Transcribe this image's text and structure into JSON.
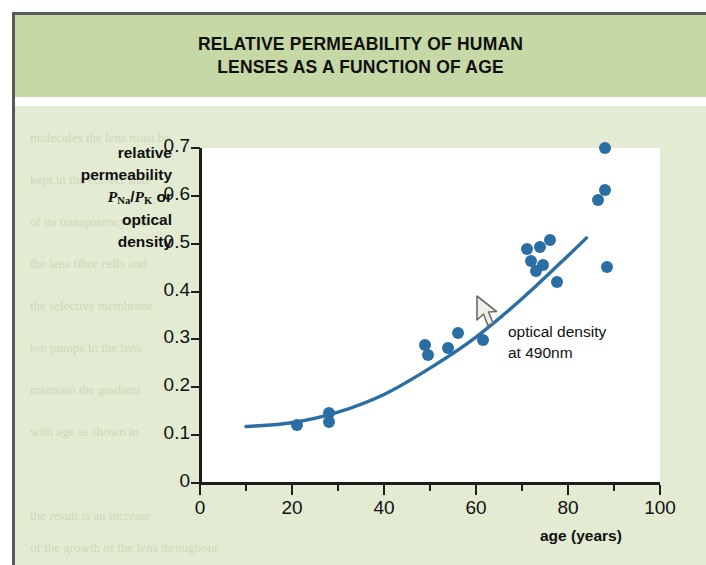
{
  "title": {
    "line1": "RELATIVE PERMEABILITY OF HUMAN",
    "line2": "LENSES AS A FUNCTION OF AGE"
  },
  "axes": {
    "y_title_lines": [
      "relative",
      "permeability",
      "P_Na/P_K or",
      "optical",
      "density"
    ],
    "y_title_part_1": "relative",
    "y_title_part_2": "permeability",
    "y_title_sym_P1": "P",
    "y_title_sub_Na": "Na",
    "y_title_slash": "/",
    "y_title_sym_P2": "P",
    "y_title_sub_K": "K",
    "y_title_or": " or",
    "y_title_part_4": "optical",
    "y_title_part_5": "density",
    "x_title": "age (years)",
    "y_ticks": [
      "0.7",
      "0.6",
      "0.5",
      "0.4",
      "0.3",
      "0.2",
      "0.1",
      "0"
    ],
    "x_ticks": [
      "0",
      "20",
      "40",
      "60",
      "80",
      "100"
    ]
  },
  "annotation": {
    "line1": "optical density",
    "line2": "at 490nm",
    "cursor": "arrow-cursor-icon"
  },
  "colors": {
    "marker": "#2a6ea3",
    "curve": "#2a6ea3",
    "header_band": "#c6d8a5",
    "body_band": "#e3ecd3",
    "plot_background": "#ffffff",
    "axis": "#1d1d1d"
  },
  "bleed_text": [
    "molecules the lens must be",
    "kept in the correct state",
    "of its transparency that",
    "the lens fibre cells and",
    "the selective membrane",
    "ion pumps in the lens",
    "maintain the gradient",
    "with age as shown in",
    "the result is an increase",
    "of the growth of the lens throughout"
  ],
  "chart_data": {
    "type": "scatter",
    "title": "RELATIVE PERMEABILITY OF HUMAN LENSES AS A FUNCTION OF AGE",
    "xlabel": "age (years)",
    "ylabel": "relative permeability PNa/PK or optical density",
    "xlim": [
      0,
      100
    ],
    "ylim": [
      0,
      0.7
    ],
    "xticks": [
      0,
      20,
      40,
      60,
      80,
      100
    ],
    "xticks_minor": [
      10,
      30,
      50,
      70,
      90
    ],
    "yticks": [
      0,
      0.1,
      0.2,
      0.3,
      0.4,
      0.5,
      0.6,
      0.7
    ],
    "grid": false,
    "legend": false,
    "series": [
      {
        "name": "optical density at 490nm",
        "marker": "filled-circle",
        "color": "#2a6ea3",
        "points": [
          {
            "x": 21,
            "y": 0.121
          },
          {
            "x": 28,
            "y": 0.146
          },
          {
            "x": 28,
            "y": 0.127
          },
          {
            "x": 49,
            "y": 0.289
          },
          {
            "x": 49.5,
            "y": 0.268
          },
          {
            "x": 54,
            "y": 0.283
          },
          {
            "x": 56,
            "y": 0.313
          },
          {
            "x": 61.5,
            "y": 0.299
          },
          {
            "x": 71,
            "y": 0.489
          },
          {
            "x": 72,
            "y": 0.464
          },
          {
            "x": 73,
            "y": 0.442
          },
          {
            "x": 74,
            "y": 0.493
          },
          {
            "x": 74.5,
            "y": 0.456
          },
          {
            "x": 76,
            "y": 0.508
          },
          {
            "x": 77.5,
            "y": 0.421
          },
          {
            "x": 88,
            "y": 0.7
          },
          {
            "x": 88,
            "y": 0.613
          },
          {
            "x": 86.5,
            "y": 0.591
          },
          {
            "x": 88.5,
            "y": 0.452
          }
        ]
      },
      {
        "name": "fitted curve",
        "type": "line",
        "color": "#2a6ea3",
        "points": [
          {
            "x": 10,
            "y": 0.118
          },
          {
            "x": 20,
            "y": 0.126
          },
          {
            "x": 30,
            "y": 0.148
          },
          {
            "x": 40,
            "y": 0.185
          },
          {
            "x": 50,
            "y": 0.24
          },
          {
            "x": 60,
            "y": 0.305
          },
          {
            "x": 70,
            "y": 0.385
          },
          {
            "x": 80,
            "y": 0.475
          },
          {
            "x": 84,
            "y": 0.512
          }
        ]
      }
    ]
  }
}
